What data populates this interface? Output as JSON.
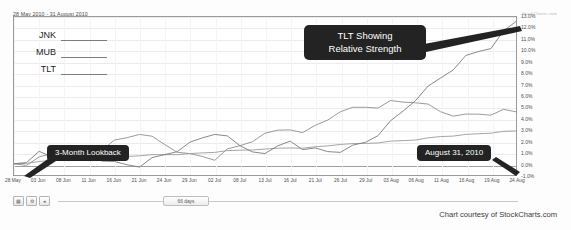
{
  "header": {
    "date_range": "28 May 2010 - 31 August 2010",
    "corner_credit": "StockCharts.com"
  },
  "footer": {
    "credit": "Chart courtesy of StockCharts.com"
  },
  "toolbar": {
    "buttons": [
      {
        "name": "grid-icon",
        "glyph": "▦"
      },
      {
        "name": "settings-icon",
        "glyph": "⚙"
      },
      {
        "name": "zoom-out-icon",
        "glyph": "◂"
      }
    ],
    "slider_label": "66 days"
  },
  "annotations": {
    "tlt_strength": "TLT Showing\nRelative Strength",
    "lookback": "3-Month Lookback",
    "end_date": "August 31, 2010"
  },
  "chart_data": {
    "type": "line",
    "title": "28 May 2010 - 31 August 2010",
    "xlabel": "",
    "ylabel": "Percent Change",
    "ylim": [
      -1.0,
      13.0
    ],
    "grid": true,
    "legend_position": "top-left",
    "y_ticks": [
      "13.0%",
      "12.0%",
      "11.0%",
      "10.0%",
      "9.0%",
      "8.0%",
      "7.0%",
      "6.0%",
      "5.0%",
      "4.0%",
      "3.0%",
      "2.0%",
      "1.0%",
      "0.0%",
      "-1.0%"
    ],
    "y_tick_values": [
      13.0,
      12.0,
      11.0,
      10.0,
      9.0,
      8.0,
      7.0,
      6.0,
      5.0,
      4.0,
      3.0,
      2.0,
      1.0,
      0.0,
      -1.0
    ],
    "categories": [
      "28 May",
      "03 Jun",
      "08 Jun",
      "11 Jun",
      "16 Jun",
      "21 Jun",
      "24 Jun",
      "29 Jun",
      "02 Jul",
      "08 Jul",
      "13 Jul",
      "16 Jul",
      "21 Jul",
      "26 Jul",
      "29 Jul",
      "03 Aug",
      "06 Aug",
      "11 Aug",
      "16 Aug",
      "19 Aug",
      "24 Aug"
    ],
    "series": [
      {
        "name": "JNK",
        "color": "#8f8f8f",
        "values": [
          0.0,
          0.6,
          1.4,
          1.0,
          2.1,
          2.6,
          1.7,
          0.9,
          0.3,
          1.6,
          2.7,
          3.0,
          3.4,
          4.6,
          5.0,
          5.6,
          5.4,
          4.6,
          4.4,
          4.3,
          4.6
        ]
      },
      {
        "name": "MUB",
        "color": "#9b9b9b",
        "values": [
          0.0,
          0.2,
          0.4,
          0.3,
          0.6,
          0.7,
          0.8,
          0.9,
          1.0,
          1.2,
          1.3,
          1.4,
          1.5,
          1.7,
          1.8,
          2.0,
          2.1,
          2.4,
          2.6,
          2.7,
          2.9
        ]
      },
      {
        "name": "TLT",
        "color": "#7a7a7a",
        "values": [
          0.0,
          1.1,
          0.4,
          1.0,
          0.2,
          -0.3,
          0.8,
          1.9,
          2.6,
          1.6,
          0.9,
          2.0,
          1.4,
          1.0,
          1.9,
          3.8,
          5.6,
          7.6,
          9.6,
          10.2,
          12.6
        ]
      }
    ],
    "legend": [
      {
        "label": "JNK"
      },
      {
        "label": "MUB"
      },
      {
        "label": "TLT"
      }
    ]
  }
}
